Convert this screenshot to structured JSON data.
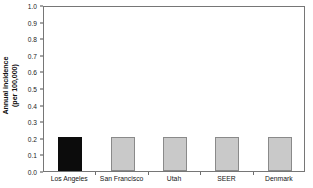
{
  "chart_data": {
    "type": "bar",
    "title": "",
    "subtitle": "",
    "xlabel": "",
    "ylabel": "Annual incidence (per 100,000)",
    "ylabel_line1": "Annual incidence",
    "ylabel_line2": "(per 100,000)",
    "categories": [
      "Los Angeles",
      "San Francisco",
      "Utah",
      "SEER",
      "Denmark"
    ],
    "values": [
      0.205,
      0.205,
      0.205,
      0.205,
      0.205
    ],
    "ylim": [
      0.0,
      1.0
    ],
    "ytick_values": [
      0.0,
      0.1,
      0.2,
      0.3,
      0.4,
      0.5,
      0.6,
      0.7,
      0.8,
      0.9,
      1.0
    ],
    "ytick_labels": [
      "0.0",
      "0.1",
      "0.2",
      "0.3",
      "0.4",
      "0.5",
      "0.6",
      "0.7",
      "0.8",
      "0.9",
      "1.0"
    ],
    "grid": false,
    "legend": "none",
    "bar_colors": [
      "#0c0c0c",
      "#c9c9c9",
      "#c9c9c9",
      "#c9c9c9",
      "#c9c9c9"
    ],
    "bar_edge_colors": [
      "#0c0c0c",
      "#8a8a8a",
      "#8a8a8a",
      "#8a8a8a",
      "#8a8a8a"
    ],
    "highlight_category": "Los Angeles",
    "frame_color": "#767676",
    "text_color": "#141414"
  }
}
